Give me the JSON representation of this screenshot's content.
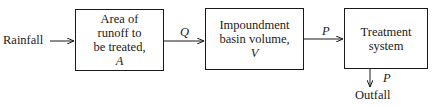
{
  "diagram": {
    "input_label": "Rainfall",
    "output_label": "Outfall",
    "boxes": [
      {
        "lines": [
          "Area of",
          "runoff to",
          "be treated,"
        ],
        "symbol": "A"
      },
      {
        "lines": [
          "Impoundment",
          "basin volume,"
        ],
        "symbol": "V"
      },
      {
        "lines": [
          "Treatment",
          "system"
        ],
        "symbol": ""
      }
    ],
    "edges": [
      {
        "from": "Rainfall",
        "to": "Area of runoff to be treated",
        "label": ""
      },
      {
        "from": "Area of runoff to be treated",
        "to": "Impoundment basin volume",
        "label": "Q"
      },
      {
        "from": "Impoundment basin volume",
        "to": "Treatment system",
        "label": "P"
      },
      {
        "from": "Treatment system",
        "to": "Outfall",
        "label": "P"
      }
    ]
  }
}
